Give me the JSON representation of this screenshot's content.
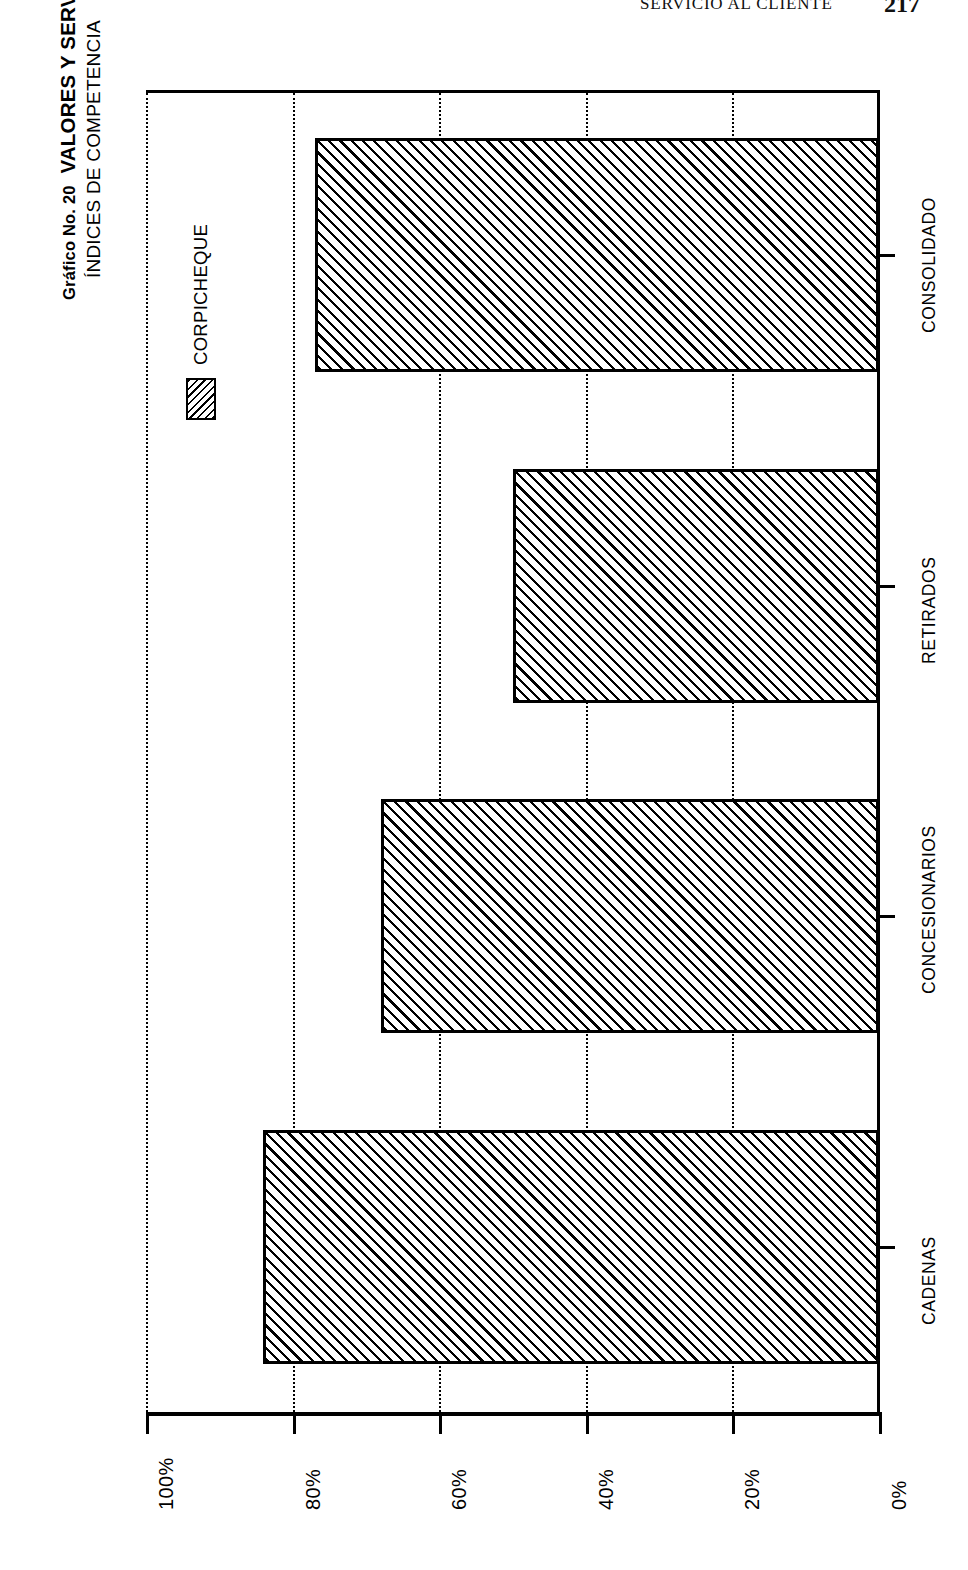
{
  "header": {
    "running_title": "SERVICIO AL CLIENTE",
    "page_number": "217"
  },
  "chart_data": {
    "type": "bar",
    "orientation": "horizontal",
    "title_prefix": "Gráfico No. 20",
    "title_main": "VALORES Y SERVICIOS S.A.",
    "subtitle": "ÍNDICES DE COMPETENCIA",
    "categories": [
      "CADENAS",
      "CONCESIONARIOS",
      "RETIRADOS",
      "CONSOLIDADO"
    ],
    "values": [
      84,
      68,
      50,
      77
    ],
    "series": [
      {
        "name": "CORPICHEQUE",
        "values": [
          84,
          68,
          50,
          77
        ]
      }
    ],
    "legend": [
      "CORPICHEQUE"
    ],
    "legend_position": "top-left",
    "xlabel": "",
    "ylabel": "",
    "ylim": [
      0,
      100
    ],
    "tick_labels": [
      "100%",
      "80%",
      "60%",
      "40%",
      "20%",
      "0%"
    ],
    "tick_values": [
      100,
      80,
      60,
      40,
      20,
      0
    ],
    "grid": true,
    "grid_style": "dotted",
    "bar_fill": "diagonal-hatch",
    "colors": {
      "ink": "#000000",
      "paper": "#ffffff"
    }
  }
}
